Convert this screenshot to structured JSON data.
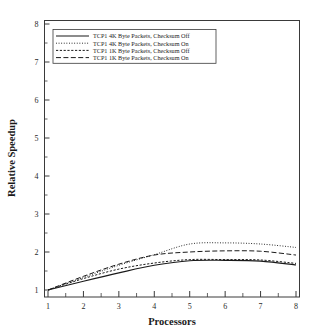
{
  "chart_data": {
    "type": "line",
    "title": "",
    "xlabel": "Processors",
    "ylabel": "Relative Speedup",
    "xlim": [
      1,
      8
    ],
    "ylim": [
      1,
      8
    ],
    "xticks": [
      "1",
      "2",
      "3",
      "4",
      "5",
      "6",
      "7",
      "8"
    ],
    "yticks": [
      "1",
      "2",
      "3",
      "4",
      "5",
      "6",
      "7",
      "8"
    ],
    "minor_ticks": true,
    "grid": false,
    "legend_position": "upper-left",
    "x": [
      1,
      2,
      3,
      4,
      5,
      6,
      7,
      8
    ],
    "series": [
      {
        "name": "TCP1 4K Byte Packets, Checksum Off",
        "style": "solid",
        "values": [
          1.0,
          1.23,
          1.45,
          1.65,
          1.77,
          1.78,
          1.76,
          1.66
        ]
      },
      {
        "name": "TCP1 4K Byte Packets, Checksum On",
        "style": "dotted",
        "values": [
          1.0,
          1.33,
          1.65,
          1.93,
          2.21,
          2.24,
          2.21,
          2.12
        ]
      },
      {
        "name": "TCP1 1K Byte Packets, Checksum Off",
        "style": "dashed-short",
        "values": [
          1.0,
          1.3,
          1.55,
          1.71,
          1.8,
          1.8,
          1.79,
          1.7
        ]
      },
      {
        "name": "TCP1 1K Byte Packets, Checksum On",
        "style": "dashed-long",
        "values": [
          1.0,
          1.36,
          1.68,
          1.92,
          2.0,
          2.03,
          2.02,
          1.92
        ]
      }
    ]
  },
  "axes": {
    "x_title": "Processors",
    "y_title": "Relative Speedup"
  },
  "legend": {
    "items": [
      {
        "label": "TCP1 4K Byte Packets, Checksum Off"
      },
      {
        "label": "TCP1 4K Byte Packets, Checksum On"
      },
      {
        "label": "TCP1 1K Byte Packets, Checksum Off"
      },
      {
        "label": "TCP1 1K Byte Packets, Checksum On"
      }
    ]
  },
  "colors": {
    "line": "#1a1a1a",
    "axis": "#3a3a3a",
    "background": "#ffffff"
  }
}
